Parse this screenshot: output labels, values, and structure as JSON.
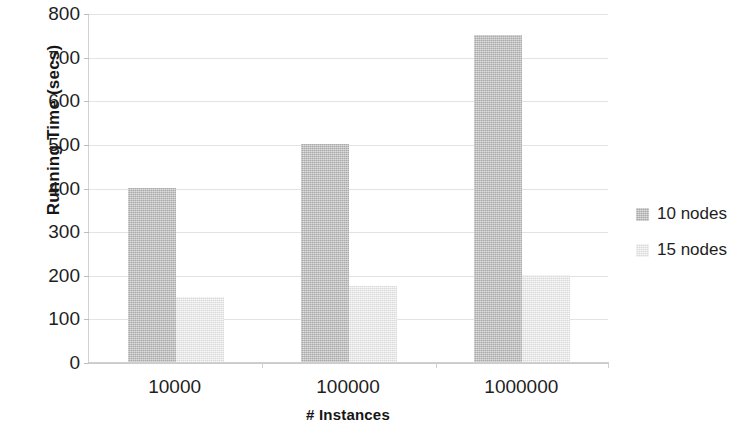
{
  "chart_data": {
    "type": "bar",
    "title": "",
    "xlabel": "# Instances",
    "ylabel": "Running Time (secs)",
    "categories": [
      "10000",
      "100000",
      "1000000"
    ],
    "series": [
      {
        "name": "10 nodes",
        "color": "#bdbdbd",
        "values": [
          400,
          500,
          750
        ]
      },
      {
        "name": "15 nodes",
        "color": "#e9e9e9",
        "values": [
          150,
          175,
          200
        ]
      }
    ],
    "ylim": [
      0,
      800
    ],
    "yticks": [
      0,
      100,
      200,
      300,
      400,
      500,
      600,
      700,
      800
    ],
    "ytick_labels": [
      "0",
      "100",
      "200",
      "300",
      "400",
      "500",
      "600",
      "700",
      "800"
    ],
    "grid": true,
    "grid_axis": "y",
    "legend_position": "right",
    "background_color": "#ffffff",
    "gridline_color": "#e3e3e3",
    "axis_color": "#cfcfcf"
  },
  "legend": {
    "items": [
      {
        "label": "10 nodes",
        "swatch": "legend-swatch-10-nodes"
      },
      {
        "label": "15 nodes",
        "swatch": "legend-swatch-15-nodes"
      }
    ]
  }
}
